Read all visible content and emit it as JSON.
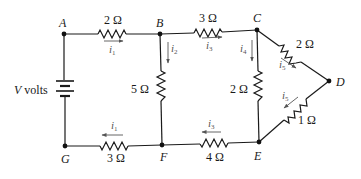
{
  "diagram": {
    "type": "electrical-circuit",
    "nodes": [
      {
        "id": "A",
        "label": "A"
      },
      {
        "id": "B",
        "label": "B"
      },
      {
        "id": "C",
        "label": "C"
      },
      {
        "id": "D",
        "label": "D"
      },
      {
        "id": "E",
        "label": "E"
      },
      {
        "id": "F",
        "label": "F"
      },
      {
        "id": "G",
        "label": "G"
      }
    ],
    "source": {
      "label": "V volts",
      "italic_part": "V",
      "rest": " volts",
      "between": [
        "A",
        "G"
      ]
    },
    "resistors": [
      {
        "id": "R_AB",
        "label": "2 Ω",
        "between": [
          "A",
          "B"
        ]
      },
      {
        "id": "R_BC",
        "label": "3 Ω",
        "between": [
          "B",
          "C"
        ]
      },
      {
        "id": "R_BF",
        "label": "5 Ω",
        "between": [
          "B",
          "F"
        ]
      },
      {
        "id": "R_CE",
        "label": "2 Ω",
        "between": [
          "C",
          "E"
        ]
      },
      {
        "id": "R_CD",
        "label": "2 Ω",
        "between": [
          "C",
          "D"
        ]
      },
      {
        "id": "R_DE",
        "label": "1 Ω",
        "between": [
          "D",
          "E"
        ]
      },
      {
        "id": "R_EF",
        "label": "4 Ω",
        "between": [
          "E",
          "F"
        ]
      },
      {
        "id": "R_FG",
        "label": "3 Ω",
        "between": [
          "F",
          "G"
        ]
      }
    ],
    "currents": [
      {
        "id": "i1_top",
        "symbol": "i",
        "sub": "1",
        "branch": "A→B",
        "direction": "right"
      },
      {
        "id": "i2",
        "symbol": "i",
        "sub": "2",
        "branch": "B→F",
        "direction": "down"
      },
      {
        "id": "i3_top",
        "symbol": "i",
        "sub": "3",
        "branch": "B→C",
        "direction": "right"
      },
      {
        "id": "i4",
        "symbol": "i",
        "sub": "4",
        "branch": "C→E",
        "direction": "down"
      },
      {
        "id": "i5_top",
        "symbol": "i",
        "sub": "5",
        "branch": "C→D",
        "direction": "down-right"
      },
      {
        "id": "i5_bottom",
        "symbol": "i",
        "sub": "5",
        "branch": "D→E",
        "direction": "down-left"
      },
      {
        "id": "i3_bottom",
        "symbol": "i",
        "sub": "3",
        "branch": "E→F",
        "direction": "left"
      },
      {
        "id": "i1_bottom",
        "symbol": "i",
        "sub": "1",
        "branch": "F→G",
        "direction": "left"
      }
    ]
  }
}
